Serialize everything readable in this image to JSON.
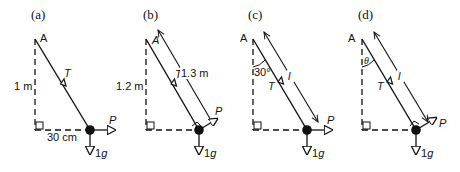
{
  "panels": [
    {
      "label": "(a)",
      "pivot": "A",
      "vertical_length": "1 m",
      "horizontal_length": "30 cm",
      "tension": "T",
      "force": "P",
      "weight": "1g"
    },
    {
      "label": "(b)",
      "pivot": "A",
      "vertical_length": "1.2 m",
      "string_length": "1.3 m",
      "tension": "T",
      "force": "P",
      "weight": "1g"
    },
    {
      "label": "(c)",
      "pivot": "A",
      "angle": "30°",
      "string_length": "l",
      "tension": "T",
      "force": "P",
      "weight": "1g"
    },
    {
      "label": "(d)",
      "pivot": "A",
      "angle": "θ",
      "string_length": "l",
      "tension": "T",
      "force": "P",
      "weight": "1g"
    }
  ],
  "colors": {
    "ink": "#111111",
    "background": "#ffffff"
  }
}
